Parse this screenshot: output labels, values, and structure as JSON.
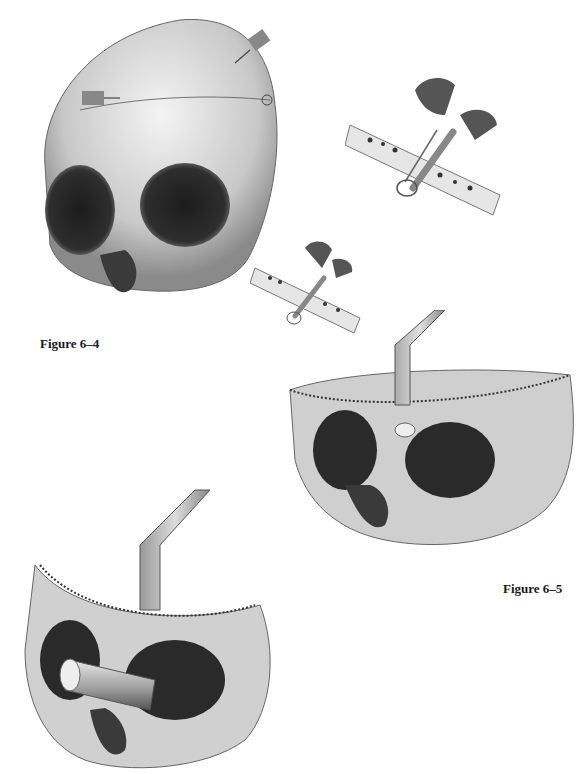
{
  "page": {
    "background": "#ffffff",
    "ink_color": "#1a1a1a"
  },
  "figures": [
    {
      "id": "figure-6-4",
      "caption": "Figure 6–4",
      "description": "Skull frontal view with two syringe/needle instruments at forehead and a suture line; two inset cross-section details of bone drilling"
    },
    {
      "id": "figure-6-5",
      "caption": "Figure 6–5",
      "description": "Skull with frontal bone removed, retractor instrument and burr at glabella"
    },
    {
      "id": "figure-6-6-partial",
      "caption": "",
      "description": "Skull with frontal bone removed, retractor and cylindrical instrument inserted into orbit"
    }
  ]
}
